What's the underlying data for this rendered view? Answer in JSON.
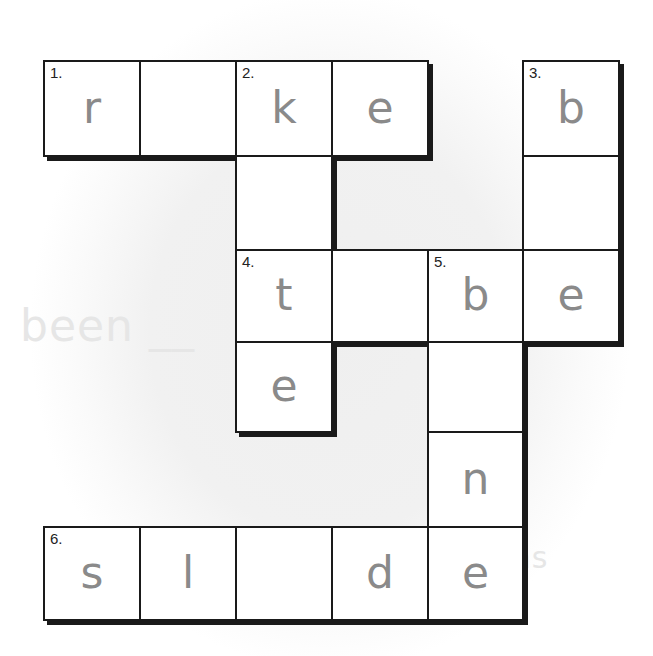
{
  "puzzle": {
    "type": "crossword",
    "letter_color": "#8a8a8a",
    "border_color": "#1a1a1a",
    "background_ghost_text": [
      "...",
      "been __",
      "...ms"
    ],
    "grid": {
      "col_x": [
        44,
        140,
        236,
        332,
        428,
        523,
        619
      ],
      "row_y": [
        61,
        156,
        250,
        342,
        432,
        527,
        620
      ]
    },
    "cells": [
      {
        "r": 0,
        "c": 0,
        "num": "1.",
        "letter": "r"
      },
      {
        "r": 0,
        "c": 1,
        "num": "",
        "letter": ""
      },
      {
        "r": 0,
        "c": 2,
        "num": "2.",
        "letter": "k"
      },
      {
        "r": 0,
        "c": 3,
        "num": "",
        "letter": "e"
      },
      {
        "r": 0,
        "c": 5,
        "num": "3.",
        "letter": "b"
      },
      {
        "r": 1,
        "c": 2,
        "num": "",
        "letter": ""
      },
      {
        "r": 1,
        "c": 5,
        "num": "",
        "letter": ""
      },
      {
        "r": 2,
        "c": 2,
        "num": "4.",
        "letter": "t"
      },
      {
        "r": 2,
        "c": 3,
        "num": "",
        "letter": ""
      },
      {
        "r": 2,
        "c": 4,
        "num": "5.",
        "letter": "b"
      },
      {
        "r": 2,
        "c": 5,
        "num": "",
        "letter": "e"
      },
      {
        "r": 3,
        "c": 2,
        "num": "",
        "letter": "e"
      },
      {
        "r": 3,
        "c": 4,
        "num": "",
        "letter": ""
      },
      {
        "r": 4,
        "c": 4,
        "num": "",
        "letter": "n"
      },
      {
        "r": 5,
        "c": 0,
        "num": "6.",
        "letter": "s"
      },
      {
        "r": 5,
        "c": 1,
        "num": "",
        "letter": "l"
      },
      {
        "r": 5,
        "c": 2,
        "num": "",
        "letter": ""
      },
      {
        "r": 5,
        "c": 3,
        "num": "",
        "letter": "d"
      },
      {
        "r": 5,
        "c": 4,
        "num": "",
        "letter": "e"
      }
    ],
    "entries": [
      {
        "number": 1,
        "direction": "across",
        "pattern": "r_ke"
      },
      {
        "number": 2,
        "direction": "down",
        "pattern": "k_te"
      },
      {
        "number": 3,
        "direction": "down",
        "pattern": "b_e"
      },
      {
        "number": 4,
        "direction": "across",
        "pattern": "t_be"
      },
      {
        "number": 5,
        "direction": "down",
        "pattern": "b_ne"
      },
      {
        "number": 6,
        "direction": "across",
        "pattern": "sl_de"
      }
    ]
  }
}
